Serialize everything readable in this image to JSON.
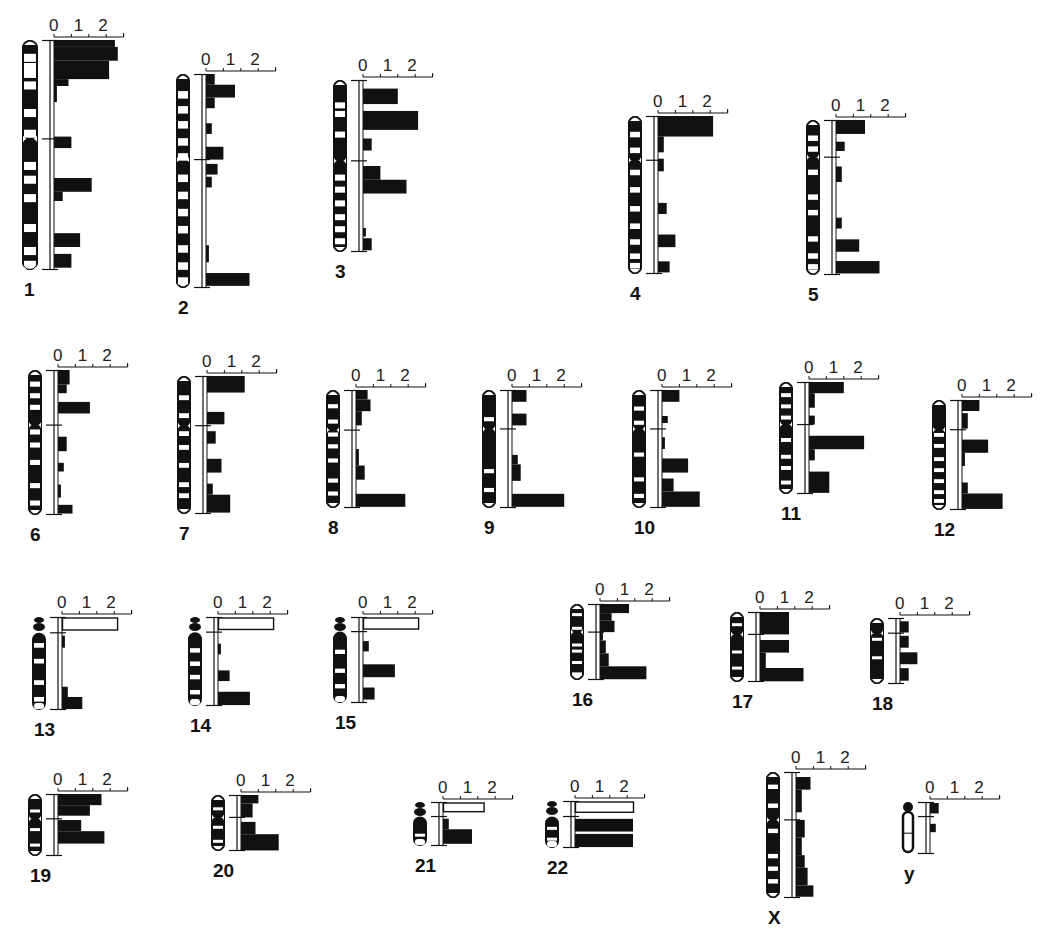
{
  "chart_data": {
    "type": "bar",
    "title": "",
    "xlabel": "",
    "ylabel": "",
    "scale_ticks": [
      "0",
      "1",
      "2"
    ],
    "xlim": [
      0,
      2.4
    ],
    "orientation": "horizontal bars along each chromosome ideogram",
    "grid": false,
    "legend": null,
    "note": "Relative values per chromosomal band segment, read top (pter) to bottom (qter). Outlined (open) bars are shown for the short arms of acrocentric chromosomes 13, 14, 15, 21, 22.",
    "chromosomes": [
      {
        "label": "1",
        "x": 22,
        "y": 40,
        "h": 230,
        "cen": 0.43,
        "w": 16,
        "acro": false,
        "bars": [
          [
            0.0,
            0.03,
            2.1
          ],
          [
            0.03,
            0.09,
            2.2
          ],
          [
            0.09,
            0.17,
            1.9
          ],
          [
            0.17,
            0.2,
            0.5
          ],
          [
            0.2,
            0.27,
            0.1
          ],
          [
            0.42,
            0.47,
            0.6
          ],
          [
            0.6,
            0.66,
            1.3
          ],
          [
            0.66,
            0.7,
            0.3
          ],
          [
            0.84,
            0.9,
            0.9
          ],
          [
            0.93,
            0.99,
            0.6
          ]
        ],
        "open": [],
        "bands": [
          0.06,
          0.1,
          0.13,
          0.18,
          0.3,
          0.39,
          0.53,
          0.59,
          0.67,
          0.8,
          0.9,
          0.96
        ]
      },
      {
        "label": "2",
        "x": 176,
        "y": 74,
        "h": 214,
        "cen": 0.4,
        "w": 14,
        "acro": false,
        "bars": [
          [
            0.0,
            0.05,
            0.3
          ],
          [
            0.05,
            0.11,
            1.0
          ],
          [
            0.11,
            0.16,
            0.3
          ],
          [
            0.23,
            0.28,
            0.2
          ],
          [
            0.34,
            0.4,
            0.6
          ],
          [
            0.42,
            0.47,
            0.4
          ],
          [
            0.48,
            0.53,
            0.2
          ],
          [
            0.8,
            0.88,
            0.1
          ],
          [
            0.93,
            0.99,
            1.5
          ]
        ],
        "open": [],
        "bands": [
          0.08,
          0.15,
          0.22,
          0.3,
          0.37,
          0.47,
          0.55,
          0.63,
          0.71,
          0.8,
          0.88,
          0.95
        ]
      },
      {
        "label": "3",
        "x": 333,
        "y": 80,
        "h": 172,
        "cen": 0.47,
        "w": 14,
        "acro": false,
        "bars": [
          [
            0.05,
            0.14,
            1.2
          ],
          [
            0.18,
            0.29,
            1.9
          ],
          [
            0.34,
            0.41,
            0.3
          ],
          [
            0.5,
            0.58,
            0.6
          ],
          [
            0.58,
            0.66,
            1.5
          ],
          [
            0.86,
            0.91,
            0.1
          ],
          [
            0.92,
            0.99,
            0.3
          ]
        ],
        "open": [],
        "bands": [
          0.13,
          0.18,
          0.3,
          0.55,
          0.62,
          0.7,
          0.78,
          0.85,
          0.92
        ]
      },
      {
        "label": "4",
        "x": 628,
        "y": 116,
        "h": 158,
        "cen": 0.28,
        "w": 14,
        "acro": false,
        "bars": [
          [
            0.0,
            0.13,
            1.9
          ],
          [
            0.13,
            0.23,
            0.2
          ],
          [
            0.27,
            0.35,
            0.2
          ],
          [
            0.55,
            0.62,
            0.3
          ],
          [
            0.75,
            0.83,
            0.6
          ],
          [
            0.92,
            0.99,
            0.4
          ]
        ],
        "open": [],
        "bands": [
          0.1,
          0.2,
          0.34,
          0.45,
          0.57,
          0.68,
          0.78,
          0.87,
          0.93
        ]
      },
      {
        "label": "5",
        "x": 806,
        "y": 120,
        "h": 155,
        "cen": 0.24,
        "w": 14,
        "acro": false,
        "bars": [
          [
            0.0,
            0.09,
            1.0
          ],
          [
            0.14,
            0.2,
            0.3
          ],
          [
            0.3,
            0.4,
            0.2
          ],
          [
            0.63,
            0.7,
            0.2
          ],
          [
            0.77,
            0.85,
            0.8
          ],
          [
            0.91,
            0.99,
            1.5
          ]
        ],
        "open": [],
        "bands": [
          0.1,
          0.17,
          0.32,
          0.48,
          0.58,
          0.75,
          0.86,
          0.93
        ]
      },
      {
        "label": "6",
        "x": 28,
        "y": 370,
        "h": 145,
        "cen": 0.38,
        "w": 14,
        "acro": false,
        "bars": [
          [
            0.0,
            0.1,
            0.4
          ],
          [
            0.1,
            0.16,
            0.3
          ],
          [
            0.22,
            0.3,
            1.1
          ],
          [
            0.46,
            0.56,
            0.3
          ],
          [
            0.64,
            0.7,
            0.2
          ],
          [
            0.79,
            0.88,
            0.1
          ],
          [
            0.93,
            0.99,
            0.5
          ]
        ],
        "open": [],
        "bands": [
          0.08,
          0.16,
          0.24,
          0.41,
          0.5,
          0.62,
          0.78,
          0.9
        ]
      },
      {
        "label": "7",
        "x": 177,
        "y": 376,
        "h": 138,
        "cen": 0.36,
        "w": 14,
        "acro": false,
        "bars": [
          [
            0.0,
            0.12,
            1.3
          ],
          [
            0.26,
            0.35,
            0.6
          ],
          [
            0.4,
            0.49,
            0.3
          ],
          [
            0.6,
            0.7,
            0.5
          ],
          [
            0.78,
            0.86,
            0.2
          ],
          [
            0.86,
            0.99,
            0.8
          ]
        ],
        "open": [],
        "bands": [
          0.14,
          0.27,
          0.4,
          0.5,
          0.63,
          0.77,
          0.85
        ]
      },
      {
        "label": "8",
        "x": 326,
        "y": 390,
        "h": 118,
        "cen": 0.34,
        "w": 14,
        "acro": false,
        "bars": [
          [
            0.0,
            0.08,
            0.4
          ],
          [
            0.08,
            0.18,
            0.5
          ],
          [
            0.18,
            0.3,
            0.2
          ],
          [
            0.5,
            0.64,
            0.1
          ],
          [
            0.64,
            0.76,
            0.3
          ],
          [
            0.88,
            0.99,
            1.7
          ]
        ],
        "open": [],
        "bands": [
          0.12,
          0.25,
          0.36,
          0.46,
          0.58,
          0.75,
          0.86
        ]
      },
      {
        "label": "9",
        "x": 482,
        "y": 390,
        "h": 118,
        "cen": 0.33,
        "w": 14,
        "acro": false,
        "bars": [
          [
            0.0,
            0.1,
            0.5
          ],
          [
            0.2,
            0.3,
            0.5
          ],
          [
            0.55,
            0.63,
            0.2
          ],
          [
            0.63,
            0.77,
            0.3
          ],
          [
            0.88,
            0.99,
            1.8
          ]
        ],
        "open": [],
        "bands": [
          0.23,
          0.67,
          0.83
        ]
      },
      {
        "label": "10",
        "x": 632,
        "y": 390,
        "h": 118,
        "cen": 0.33,
        "w": 14,
        "acro": false,
        "bars": [
          [
            0.0,
            0.1,
            0.6
          ],
          [
            0.22,
            0.28,
            0.2
          ],
          [
            0.4,
            0.5,
            0.1
          ],
          [
            0.58,
            0.7,
            0.9
          ],
          [
            0.75,
            0.86,
            0.4
          ],
          [
            0.86,
            0.99,
            1.3
          ]
        ],
        "open": [],
        "bands": [
          0.14,
          0.26,
          0.53,
          0.74,
          0.88
        ]
      },
      {
        "label": "11",
        "x": 779,
        "y": 382,
        "h": 112,
        "cen": 0.38,
        "w": 14,
        "acro": false,
        "bars": [
          [
            0.0,
            0.1,
            1.2
          ],
          [
            0.1,
            0.23,
            0.2
          ],
          [
            0.3,
            0.38,
            0.2
          ],
          [
            0.48,
            0.6,
            1.9
          ],
          [
            0.6,
            0.7,
            0.2
          ],
          [
            0.8,
            0.99,
            0.7
          ]
        ],
        "open": [],
        "bands": [
          0.1,
          0.2,
          0.3,
          0.5,
          0.65,
          0.75,
          0.88
        ]
      },
      {
        "label": "12",
        "x": 932,
        "y": 400,
        "h": 110,
        "cen": 0.27,
        "w": 14,
        "acro": false,
        "bars": [
          [
            0.0,
            0.1,
            0.6
          ],
          [
            0.12,
            0.26,
            0.2
          ],
          [
            0.36,
            0.48,
            0.9
          ],
          [
            0.48,
            0.6,
            0.1
          ],
          [
            0.75,
            0.85,
            0.2
          ],
          [
            0.85,
            0.99,
            1.4
          ]
        ],
        "open": [],
        "bands": [
          0.3,
          0.4,
          0.52,
          0.62,
          0.72,
          0.82,
          0.9
        ]
      },
      {
        "label": "13",
        "x": 32,
        "y": 617,
        "h": 93,
        "cen": 0.17,
        "w": 14,
        "acro": true,
        "bars": [
          [
            0.2,
            0.33,
            0.1
          ],
          [
            0.75,
            0.86,
            0.2
          ],
          [
            0.86,
            0.99,
            0.7
          ]
        ],
        "open": [
          [
            0.0,
            0.14,
            1.9
          ]
        ],
        "bands": [
          0.28,
          0.45,
          0.68,
          0.86
        ]
      },
      {
        "label": "14",
        "x": 188,
        "y": 617,
        "h": 89,
        "cen": 0.17,
        "w": 14,
        "acro": true,
        "bars": [
          [
            0.3,
            0.42,
            0.1
          ],
          [
            0.6,
            0.72,
            0.4
          ],
          [
            0.84,
            0.99,
            1.1
          ]
        ],
        "open": [
          [
            0.0,
            0.14,
            1.9
          ]
        ],
        "bands": [
          0.35,
          0.5,
          0.65,
          0.82
        ]
      },
      {
        "label": "15",
        "x": 333,
        "y": 617,
        "h": 86,
        "cen": 0.17,
        "w": 14,
        "acro": true,
        "bars": [
          [
            0.28,
            0.4,
            0.2
          ],
          [
            0.55,
            0.7,
            1.1
          ],
          [
            0.82,
            0.96,
            0.4
          ]
        ],
        "open": [
          [
            0.0,
            0.14,
            1.9
          ]
        ],
        "bands": [
          0.38,
          0.6,
          0.78
        ]
      },
      {
        "label": "16",
        "x": 570,
        "y": 604,
        "h": 76,
        "cen": 0.37,
        "w": 14,
        "acro": false,
        "bars": [
          [
            0.0,
            0.12,
            1.0
          ],
          [
            0.12,
            0.22,
            0.4
          ],
          [
            0.22,
            0.37,
            0.5
          ],
          [
            0.37,
            0.48,
            0.1
          ],
          [
            0.48,
            0.65,
            0.2
          ],
          [
            0.65,
            0.82,
            0.3
          ],
          [
            0.82,
            0.99,
            1.6
          ]
        ],
        "open": [],
        "bands": [
          0.12,
          0.3,
          0.52,
          0.6,
          0.75,
          0.9
        ]
      },
      {
        "label": "17",
        "x": 730,
        "y": 612,
        "h": 70,
        "cen": 0.32,
        "w": 14,
        "acro": false,
        "bars": [
          [
            0.0,
            0.32,
            1.0
          ],
          [
            0.4,
            0.58,
            1.0
          ],
          [
            0.58,
            0.8,
            0.2
          ],
          [
            0.8,
            0.99,
            1.5
          ]
        ],
        "open": [],
        "bands": [
          0.16,
          0.55,
          0.78
        ]
      },
      {
        "label": "18",
        "x": 870,
        "y": 618,
        "h": 66,
        "cen": 0.23,
        "w": 14,
        "acro": false,
        "bars": [
          [
            0.05,
            0.22,
            0.3
          ],
          [
            0.27,
            0.45,
            0.3
          ],
          [
            0.52,
            0.7,
            0.6
          ],
          [
            0.76,
            0.95,
            0.3
          ]
        ],
        "open": [],
        "bands": [
          0.3,
          0.58
        ]
      },
      {
        "label": "19",
        "x": 28,
        "y": 794,
        "h": 62,
        "cen": 0.4,
        "w": 14,
        "acro": false,
        "bars": [
          [
            0.0,
            0.18,
            1.5
          ],
          [
            0.18,
            0.35,
            1.1
          ],
          [
            0.42,
            0.6,
            0.8
          ],
          [
            0.6,
            0.8,
            1.6
          ]
        ],
        "open": [],
        "bands": [
          0.25,
          0.55,
          0.8
        ]
      },
      {
        "label": "20",
        "x": 211,
        "y": 795,
        "h": 56,
        "cen": 0.4,
        "w": 14,
        "acro": false,
        "bars": [
          [
            0.0,
            0.15,
            0.6
          ],
          [
            0.15,
            0.4,
            0.4
          ],
          [
            0.48,
            0.7,
            0.5
          ],
          [
            0.7,
            0.99,
            1.3
          ]
        ],
        "open": [],
        "bands": [
          0.22,
          0.55,
          0.8
        ]
      },
      {
        "label": "21",
        "x": 413,
        "y": 802,
        "h": 44,
        "cen": 0.33,
        "w": 14,
        "acro": true,
        "bars": [
          [
            0.38,
            0.62,
            0.2
          ],
          [
            0.62,
            0.95,
            1.0
          ]
        ],
        "open": [
          [
            0.0,
            0.22,
            1.4
          ]
        ],
        "bands": [
          0.72
        ]
      },
      {
        "label": "22",
        "x": 545,
        "y": 801,
        "h": 47,
        "cen": 0.33,
        "w": 14,
        "acro": true,
        "bars": [
          [
            0.38,
            0.65,
            2.0
          ],
          [
            0.7,
            0.98,
            2.0
          ]
        ],
        "open": [
          [
            0.0,
            0.24,
            2.0
          ]
        ],
        "bands": [
          0.55,
          0.78
        ]
      },
      {
        "label": "X",
        "x": 766,
        "y": 772,
        "h": 126,
        "cen": 0.38,
        "w": 14,
        "acro": false,
        "bars": [
          [
            0.04,
            0.14,
            0.5
          ],
          [
            0.14,
            0.32,
            0.2
          ],
          [
            0.38,
            0.52,
            0.3
          ],
          [
            0.52,
            0.66,
            0.2
          ],
          [
            0.66,
            0.76,
            0.3
          ],
          [
            0.76,
            0.9,
            0.4
          ],
          [
            0.9,
            0.99,
            0.6
          ]
        ],
        "open": [],
        "bands": [
          0.1,
          0.25,
          0.45,
          0.65,
          0.75,
          0.85
        ]
      },
      {
        "label": "Y",
        "x": 902,
        "y": 802,
        "h": 52,
        "cen": 0.28,
        "w": 12,
        "acro": false,
        "bars": [
          [
            0.02,
            0.22,
            0.3
          ],
          [
            0.42,
            0.58,
            0.2
          ]
        ],
        "open": [],
        "bands": [],
        "ylike": true
      }
    ]
  },
  "labels": {
    "chr_1": "1",
    "chr_2": "2",
    "chr_3": "3",
    "chr_4": "4",
    "chr_5": "5",
    "chr_6": "6",
    "chr_7": "7",
    "chr_8": "8",
    "chr_9": "9",
    "chr_10": "10",
    "chr_11": "11",
    "chr_12": "12",
    "chr_13": "13",
    "chr_14": "14",
    "chr_15": "15",
    "chr_16": "16",
    "chr_17": "17",
    "chr_18": "18",
    "chr_19": "19",
    "chr_20": "20",
    "chr_21": "21",
    "chr_22": "22",
    "chr_X": "X",
    "chr_Y": "y"
  },
  "colors": {
    "ink": "#111111",
    "background": "#ffffff"
  }
}
